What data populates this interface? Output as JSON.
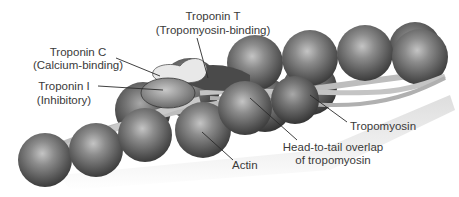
{
  "figure": {
    "labels": {
      "troponin_t": {
        "line1": "Troponin T",
        "line2": "(Tropomyosin-binding)"
      },
      "troponin_c": {
        "line1": "Troponin C",
        "line2": "(Calcium-binding)"
      },
      "troponin_i": {
        "line1": "Troponin I",
        "line2": "(Inhibitory)"
      },
      "tropomyosin": {
        "line1": "Tropomyosin"
      },
      "overlap": {
        "line1": "Head-to-tail overlap",
        "line2": "of tropomyosin"
      },
      "actin": {
        "line1": "Actin"
      }
    },
    "colors": {
      "actin_light": "#b5b5b5",
      "actin_mid": "#6e6e6e",
      "actin_dark": "#3a3a3a",
      "tropomyosin": "#c9c9c9",
      "troponin_c": "#e8e8e8",
      "troponin_i": "#8a8a8a",
      "troponin_t": "#4a4a4a",
      "text": "#3a3a3a",
      "leader": "#2a2a2a"
    }
  }
}
